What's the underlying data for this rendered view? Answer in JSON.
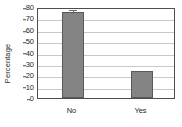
{
  "chart_data": {
    "type": "bar",
    "title": "",
    "subtitle": "",
    "xlabel": "",
    "ylabel": "Percentage",
    "categories": [
      "No",
      "Yes"
    ],
    "values": [
      76,
      24
    ],
    "series": [
      {
        "name": "Percentage",
        "values": [
          76,
          24
        ]
      }
    ],
    "errors": [
      3,
      0
    ],
    "ylim": [
      0,
      80
    ],
    "ytick_values": [
      0,
      10,
      20,
      30,
      40,
      50,
      60,
      70,
      80
    ],
    "ytick_labels": [
      "0",
      "10",
      "20",
      "30",
      "40",
      "50",
      "60",
      "70",
      "80"
    ],
    "grid": true,
    "grid_axis": "y",
    "legend": false,
    "legend_position": "none",
    "bar_color": "#848484",
    "bar_edge_color": "#5a5a5a",
    "grid_color": "#c8c8c8",
    "frame_color": "#4d4d4d",
    "text_color": "#1d1d1d",
    "background_color": "#ffffff",
    "annotations": []
  }
}
